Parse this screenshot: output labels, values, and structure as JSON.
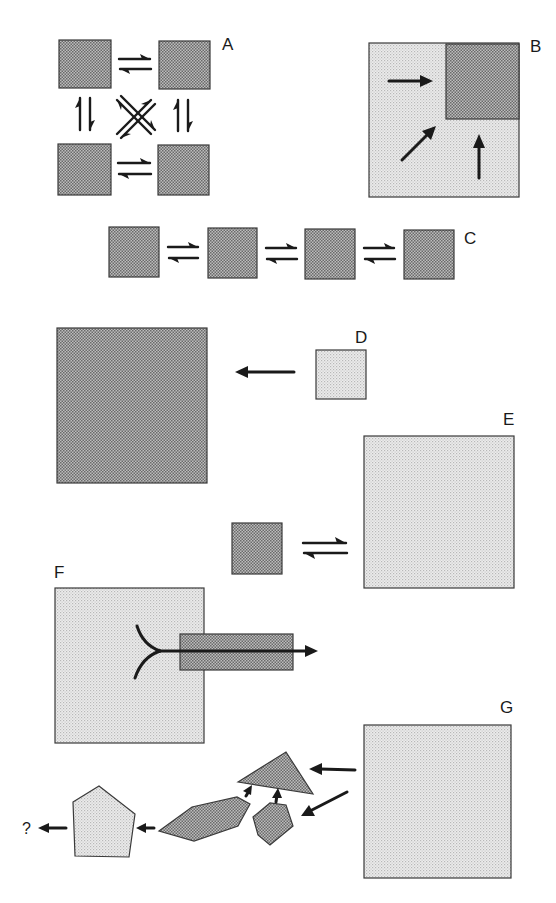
{
  "figure": {
    "colors": {
      "dark_stipple": "#9a9a9a",
      "light_stipple": "#dcdcdc",
      "outline": "#3a3a3a",
      "arrow": "#1a1a1a",
      "background": "#ffffff"
    }
  },
  "panels": {
    "A": {
      "label": "A",
      "description": "Four dark squares in a 2x2 grid, interconverting via equilibrium arrows (horizontal, vertical and crossed diagonal)"
    },
    "B": {
      "label": "B",
      "description": "Large light square with a dark square in the upper-right corner; three arrows point toward the dark square"
    },
    "C": {
      "label": "C",
      "description": "Linear chain of four dark squares connected by three equilibrium arrows"
    },
    "D": {
      "label": "D",
      "description": "Small light square with an arrow pointing left toward a large dark square"
    },
    "E": {
      "label": "E",
      "description": "Small dark square in equilibrium with a large light square"
    },
    "F": {
      "label": "F",
      "description": "Large light square with a forked line leading into a dark rectangle; arrow extends out to the right"
    },
    "G": {
      "label": "G",
      "description": "Large light square feeding arrows into fragments (triangle, polygons) that merge into a light pentagon, leading to an unknown outcome",
      "outcome_label": "?"
    }
  }
}
